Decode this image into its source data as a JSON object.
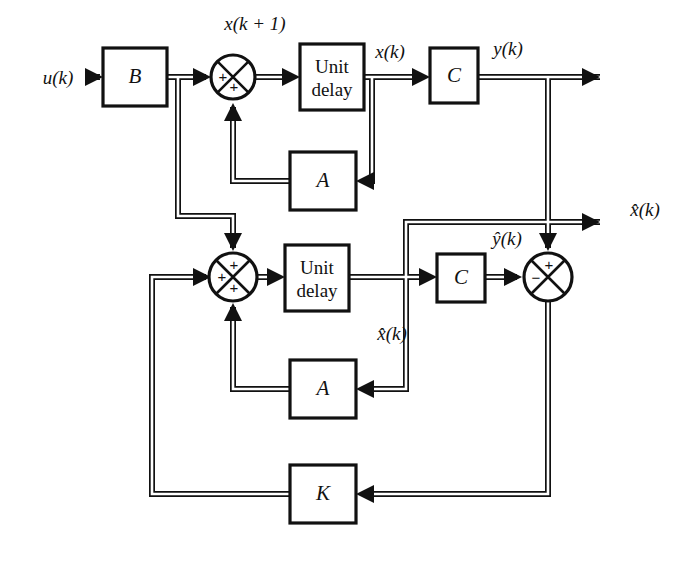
{
  "figure": {
    "kind": "block-diagram",
    "domain": "control-systems",
    "background_color": "#ffffff",
    "line_color": "#111111",
    "width": 680,
    "height": 564
  },
  "blocks": {
    "gain_b": {
      "label": "B",
      "x": 103,
      "y": 48,
      "w": 64,
      "h": 58
    },
    "unit_delay_plant": {
      "label_line1": "Unit",
      "label_line2": "delay",
      "x": 300,
      "y": 44,
      "w": 64,
      "h": 66
    },
    "gain_c_plant": {
      "label": "C",
      "x": 430,
      "y": 48,
      "w": 48,
      "h": 55
    },
    "gain_a_plant": {
      "label": "A",
      "x": 290,
      "y": 152,
      "w": 66,
      "h": 58
    },
    "unit_delay_observer": {
      "label_line1": "Unit",
      "label_line2": "delay",
      "x": 285,
      "y": 245,
      "w": 64,
      "h": 66
    },
    "gain_c_observer": {
      "label": "C",
      "x": 437,
      "y": 254,
      "w": 48,
      "h": 48
    },
    "gain_a_observer": {
      "label": "A",
      "x": 290,
      "y": 360,
      "w": 66,
      "h": 58
    },
    "gain_k": {
      "label": "K",
      "x": 290,
      "y": 465,
      "w": 66,
      "h": 58
    }
  },
  "summers": {
    "plant_sum": {
      "cx": 233,
      "cy": 77,
      "r": 22,
      "signs": [
        {
          "text": "+",
          "dx": -10,
          "dy": 1
        },
        {
          "text": "+",
          "dx": 1,
          "dy": 11
        }
      ]
    },
    "observer_sum": {
      "cx": 233,
      "cy": 277,
      "r": 24,
      "signs": [
        {
          "text": "+",
          "dx": 1,
          "dy": -11
        },
        {
          "text": "+",
          "dx": -11,
          "dy": 1
        },
        {
          "text": "+",
          "dx": 1,
          "dy": 12
        }
      ]
    },
    "error_sum": {
      "cx": 548,
      "cy": 277,
      "r": 24,
      "signs": [
        {
          "text": "+",
          "dx": 1,
          "dy": -11
        },
        {
          "text": "−",
          "dx": -12,
          "dy": 2
        }
      ]
    }
  },
  "signals": {
    "input_u": {
      "text": "u(k)",
      "x": 58,
      "y": 84
    },
    "state_next": {
      "text": "x(k + 1)",
      "x": 255,
      "y": 30
    },
    "state_x": {
      "text": "x(k)",
      "x": 390,
      "y": 58
    },
    "output_y": {
      "text": "y(k)",
      "x": 508,
      "y": 55
    },
    "state_hat_out": {
      "text": "x̂(k)",
      "x": 645,
      "y": 216
    },
    "output_hat_y": {
      "text": "ŷ(k)",
      "x": 507,
      "y": 245
    },
    "state_hat_delay": {
      "text": "x̂(k)",
      "x": 392,
      "y": 340
    }
  },
  "legend": {
    "description": "Discrete-time plant with full-order state observer. Plant path: u(k) through B into a summing junction with A-feedback, a unit delay producing x(k), and output matrix C producing y(k). Observer path: identical B, A and unit-delay structure produces x̂(k), whose estimated output ŷ(k) is subtracted from y(k); the resulting error is fed through observer gain K back into the observer summing junction."
  }
}
